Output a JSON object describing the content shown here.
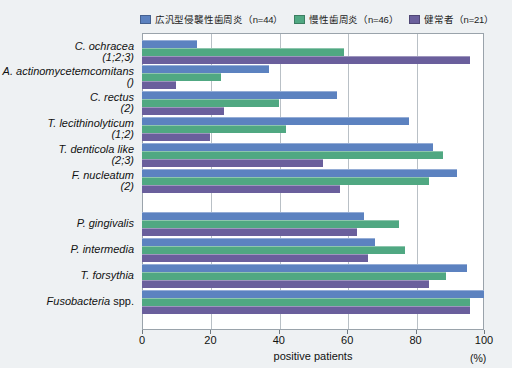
{
  "legend": {
    "items": [
      {
        "label": "広汎型侵襲性歯周炎（n=44）",
        "color": "#5c82c0",
        "name": "aggressive-periodontitis"
      },
      {
        "label": "慢性歯周炎（n=46）",
        "color": "#50a882",
        "name": "chronic-periodontitis"
      },
      {
        "label": "健常者（n=21）",
        "color": "#6a5f9c",
        "name": "healthy-subjects"
      }
    ]
  },
  "axis": {
    "x_title": "positive patients",
    "x_unit": "(%)",
    "x_ticks": [
      "0",
      "20",
      "40",
      "60",
      "80",
      "100"
    ]
  },
  "chart_data": {
    "type": "bar",
    "orientation": "horizontal",
    "title": "",
    "xlabel": "positive patients",
    "ylabel": "",
    "xlim": [
      0,
      100
    ],
    "xticks": [
      0,
      20,
      40,
      60,
      80,
      100
    ],
    "xunit": "(%)",
    "grid": "vertical",
    "legend_position": "top-right",
    "categories": [
      "C. ochracea (1;2;3)",
      "A. actinomycetemcomitans ()",
      "C. rectus (2)",
      "T. lecithinolyticum (1;2)",
      "T. denticola like (2;3)",
      "F. nucleatum (2)",
      "P. gingivalis",
      "P. intermedia",
      "T. forsythia",
      "Fusobacteria spp."
    ],
    "category_parts": [
      {
        "species": "C. ochracea",
        "roman": "",
        "note": "(1;2;3)"
      },
      {
        "species": "A. actinomycetemcomitans",
        "roman": "",
        "note": "()"
      },
      {
        "species": "C. rectus",
        "roman": "",
        "note": "(2)"
      },
      {
        "species": "T. lecithinolyticum",
        "roman": "",
        "note": "(1;2)"
      },
      {
        "species": "T. denticola like",
        "roman": "",
        "note": "(2;3)"
      },
      {
        "species": "F. nucleatum",
        "roman": "",
        "note": "(2)"
      },
      {
        "species": "P. gingivalis",
        "roman": "",
        "note": ""
      },
      {
        "species": "P. intermedia",
        "roman": "",
        "note": ""
      },
      {
        "species": "T. forsythia",
        "roman": "",
        "note": ""
      },
      {
        "species": "Fusobacteria",
        "roman": " spp.",
        "note": ""
      }
    ],
    "series": [
      {
        "name": "広汎型侵襲性歯周炎（n=44）",
        "color": "#5c82c0",
        "values": [
          16,
          37,
          57,
          78,
          85,
          92,
          65,
          68,
          95,
          100
        ]
      },
      {
        "name": "慢性歯周炎（n=46）",
        "color": "#50a882",
        "values": [
          59,
          23,
          40,
          42,
          88,
          84,
          75,
          77,
          89,
          96
        ]
      },
      {
        "name": "健常者（n=21）",
        "color": "#6a5f9c",
        "values": [
          96,
          10,
          24,
          20,
          53,
          58,
          63,
          66,
          84,
          96
        ]
      }
    ]
  }
}
